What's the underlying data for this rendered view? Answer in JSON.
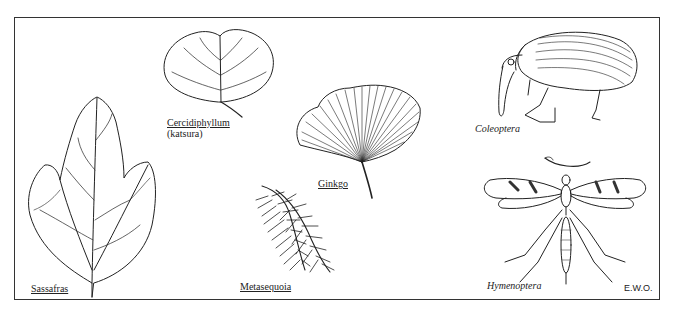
{
  "figure": {
    "specimens": [
      {
        "id": "sassafras",
        "label": "Sassafras",
        "style": "underline",
        "kind": "leaf"
      },
      {
        "id": "cercidiphyllum",
        "label": "Cercidiphyllum",
        "sublabel": "(katsura)",
        "style": "underline",
        "kind": "leaf"
      },
      {
        "id": "ginkgo",
        "label": "Ginkgo",
        "style": "underline",
        "kind": "leaf"
      },
      {
        "id": "metasequoia",
        "label": "Metasequoia",
        "style": "underline",
        "kind": "conifer-sprig"
      },
      {
        "id": "coleoptera",
        "label": "Coleoptera",
        "style": "italic",
        "kind": "insect-weevil"
      },
      {
        "id": "hymenoptera",
        "label": "Hymenoptera",
        "style": "italic",
        "kind": "insect-wasp"
      }
    ],
    "signature": "E.W.O."
  }
}
